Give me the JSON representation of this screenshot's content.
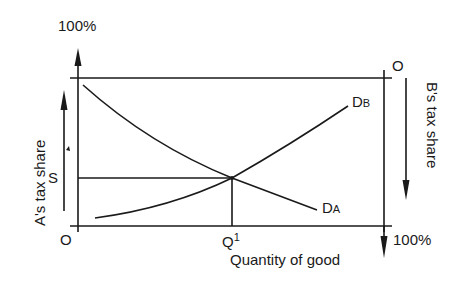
{
  "diagram": {
    "labels": {
      "top_left_percent": "100%",
      "top_right_origin": "O",
      "bottom_left_origin": "O",
      "bottom_right_percent": "100%",
      "s_label": "S",
      "q_label": "Q",
      "q_superscript": "1",
      "x_axis_label": "Quantity of good",
      "left_axis_label": "A's tax share",
      "right_axis_label": "B's tax share",
      "curve_a_main": "D",
      "curve_a_sub": "A",
      "curve_b_main": "D",
      "curve_b_sub": "B"
    },
    "curves": [
      {
        "name": "D_A",
        "direction": "downward sloping",
        "from": "high share at low quantity",
        "to": "low share at high quantity"
      },
      {
        "name": "D_B",
        "direction": "upward sloping (measured from top)",
        "from": "low share at low quantity",
        "to": "high share at high quantity"
      }
    ],
    "equilibrium": {
      "share": "S",
      "quantity": "Q1"
    },
    "colors": {
      "ink": "#1a1a1a",
      "background": "#ffffff"
    }
  }
}
